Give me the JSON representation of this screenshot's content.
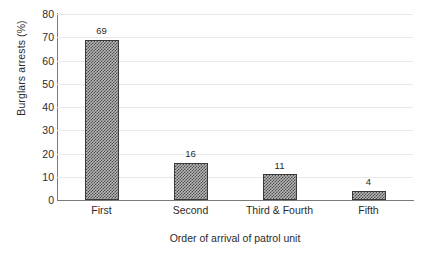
{
  "chart_data": {
    "type": "bar",
    "title": "",
    "xlabel": "Order of arrival of patrol unit",
    "ylabel": "Burglars arrests (%)",
    "categories": [
      "First",
      "Second",
      "Third & Fourth",
      "Fifth"
    ],
    "values": [
      69,
      16,
      11,
      4
    ],
    "data_labels": [
      "69",
      "16",
      "11",
      "4"
    ],
    "ylim": [
      0,
      80
    ],
    "ytick_step": 10,
    "ytick_labels": [
      "80",
      "70",
      "60",
      "50",
      "40",
      "30",
      "20",
      "10",
      "0"
    ],
    "grid": "horizontal",
    "legend": "none",
    "bar_fill": "checkerboard-hatch",
    "colors": {
      "background": "#ffffff",
      "gridline": "#e9e9e9",
      "axis": "#7a7a7a",
      "bar_outline": "#3a3a3a",
      "bar_pattern_dark": "#4a4a4a",
      "bar_pattern_light": "#b9b9b9",
      "text": "#2b2b2b"
    }
  }
}
